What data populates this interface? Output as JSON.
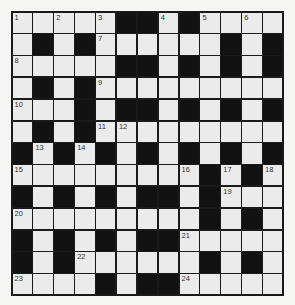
{
  "puzzle": {
    "rows": 13,
    "cols": 13,
    "colors": {
      "white": "#ebebeb",
      "black": "#121212",
      "border": "#1a1a1a"
    },
    "grid": [
      "WWWWWBBWBWWWW",
      "WBWBWWWWWWBWB",
      "WWWWWBBWBWBWB",
      "WBWBWWWWWWWWW",
      "WWWBWBBWBWBWB",
      "WBWBWWWWWWWWW",
      "BWBWBWBWBWBWB",
      "WWWWWWWWWBWBW",
      "BWBWBWBBWBWWW",
      "WWWWWWWWWBWBW",
      "BWBWBWBBWWWWW",
      "BWBWWWWWWBWBW",
      "WWWWBWBBWWWWW"
    ],
    "numbers": [
      {
        "r": 0,
        "c": 0,
        "n": "1"
      },
      {
        "r": 0,
        "c": 2,
        "n": "2"
      },
      {
        "r": 0,
        "c": 4,
        "n": "3"
      },
      {
        "r": 0,
        "c": 7,
        "n": "4"
      },
      {
        "r": 0,
        "c": 9,
        "n": "5"
      },
      {
        "r": 0,
        "c": 11,
        "n": "6"
      },
      {
        "r": 1,
        "c": 4,
        "n": "7"
      },
      {
        "r": 2,
        "c": 0,
        "n": "8"
      },
      {
        "r": 3,
        "c": 4,
        "n": "9"
      },
      {
        "r": 4,
        "c": 0,
        "n": "10"
      },
      {
        "r": 5,
        "c": 4,
        "n": "11"
      },
      {
        "r": 5,
        "c": 5,
        "n": "12"
      },
      {
        "r": 6,
        "c": 1,
        "n": "13"
      },
      {
        "r": 6,
        "c": 3,
        "n": "14"
      },
      {
        "r": 7,
        "c": 0,
        "n": "15"
      },
      {
        "r": 7,
        "c": 8,
        "n": "16"
      },
      {
        "r": 7,
        "c": 10,
        "n": "17"
      },
      {
        "r": 7,
        "c": 12,
        "n": "18"
      },
      {
        "r": 8,
        "c": 10,
        "n": "19"
      },
      {
        "r": 9,
        "c": 0,
        "n": "20"
      },
      {
        "r": 10,
        "c": 8,
        "n": "21"
      },
      {
        "r": 11,
        "c": 3,
        "n": "22"
      },
      {
        "r": 12,
        "c": 0,
        "n": "23"
      },
      {
        "r": 12,
        "c": 8,
        "n": "24"
      }
    ]
  }
}
